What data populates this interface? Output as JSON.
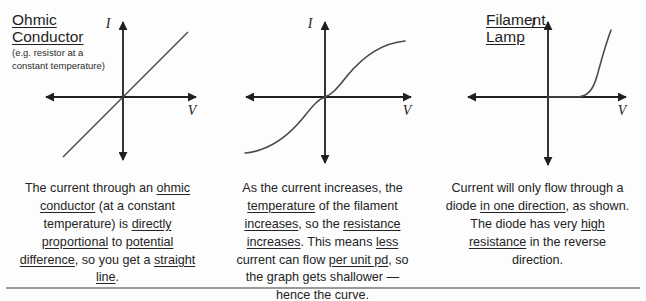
{
  "figure": {
    "panels": [
      {
        "id": "ohmic-conductor",
        "title": "Ohmic\nConductor",
        "title_line1": "Ohmic",
        "title_line2": "Conductor",
        "subtitle_line1": "(e.g. resistor at a",
        "subtitle_line2": "constant temperature)",
        "y_axis_label": "I",
        "x_axis_label": "V",
        "caption_segments": [
          {
            "text": "The current through an ",
            "underline": false
          },
          {
            "text": "ohmic conductor",
            "underline": true
          },
          {
            "text": " (at a constant temperature) is ",
            "underline": false
          },
          {
            "text": "directly proportional",
            "underline": true
          },
          {
            "text": " to ",
            "underline": false
          },
          {
            "text": "potential difference",
            "underline": true
          },
          {
            "text": ", so you get a ",
            "underline": false
          },
          {
            "text": "straight line",
            "underline": true
          },
          {
            "text": ".",
            "underline": false
          }
        ]
      },
      {
        "id": "filament-lamp",
        "title": "Filament\nLamp",
        "title_line1": "Filament",
        "title_line2": "Lamp",
        "subtitle_line1": "",
        "subtitle_line2": "",
        "y_axis_label": "I",
        "x_axis_label": "V",
        "caption_segments": [
          {
            "text": "As the current increases, the ",
            "underline": false
          },
          {
            "text": "temperature",
            "underline": true
          },
          {
            "text": " of the filament ",
            "underline": false
          },
          {
            "text": "increases",
            "underline": true
          },
          {
            "text": ", so the ",
            "underline": false
          },
          {
            "text": "resistance increases",
            "underline": true
          },
          {
            "text": ".  This means ",
            "underline": false
          },
          {
            "text": "less",
            "underline": true
          },
          {
            "text": " current can flow ",
            "underline": false
          },
          {
            "text": "per unit pd",
            "underline": true
          },
          {
            "text": ", so the graph gets shallower — hence the ",
            "underline": false
          },
          {
            "text": "curve",
            "underline": true
          },
          {
            "text": ".",
            "underline": false
          }
        ]
      },
      {
        "id": "diode",
        "title": "Diode",
        "title_line1": "Diode",
        "title_line2": "",
        "subtitle_line1": "",
        "subtitle_line2": "",
        "y_axis_label": "I",
        "x_axis_label": "V",
        "caption_segments": [
          {
            "text": "Current will only flow through a diode ",
            "underline": false
          },
          {
            "text": "in one direction",
            "underline": true
          },
          {
            "text": ", as shown. The diode has very ",
            "underline": false
          },
          {
            "text": "high resistance",
            "underline": true
          },
          {
            "text": " in the reverse direction.",
            "underline": false
          }
        ]
      }
    ]
  },
  "chart_data": [
    {
      "type": "line",
      "title": "Ohmic Conductor",
      "xlabel": "V",
      "ylabel": "I",
      "xlim": [
        -1,
        1
      ],
      "ylim": [
        -1,
        1
      ],
      "grid": false,
      "legend": "none",
      "annotation": "straight line through origin, positive constant gradient",
      "series": [
        {
          "name": "ohmic",
          "x": [
            -0.82,
            -0.4,
            0.0,
            0.4,
            0.82
          ],
          "y": [
            -0.82,
            -0.4,
            0.0,
            0.4,
            0.82
          ]
        }
      ]
    },
    {
      "type": "line",
      "title": "Filament Lamp",
      "xlabel": "V",
      "ylabel": "I",
      "xlim": [
        -1,
        1
      ],
      "ylim": [
        -1,
        1
      ],
      "grid": false,
      "legend": "none",
      "annotation": "S-shaped curve through origin, gradient decreases with magnitude of V",
      "series": [
        {
          "name": "filament",
          "x": [
            -0.95,
            -0.8,
            -0.6,
            -0.4,
            -0.2,
            0.0,
            0.2,
            0.4,
            0.6,
            0.8,
            0.95
          ],
          "y": [
            -0.72,
            -0.68,
            -0.58,
            -0.42,
            -0.22,
            0.0,
            0.22,
            0.42,
            0.58,
            0.68,
            0.72
          ]
        }
      ]
    },
    {
      "type": "line",
      "title": "Diode",
      "xlabel": "V",
      "ylabel": "I",
      "xlim": [
        -1,
        1
      ],
      "ylim": [
        -1,
        1
      ],
      "grid": false,
      "legend": "none",
      "annotation": "zero current for reverse and small forward bias; sharp exponential rise after threshold",
      "series": [
        {
          "name": "diode",
          "x": [
            -0.9,
            -0.4,
            0.0,
            0.18,
            0.3,
            0.4,
            0.48,
            0.55,
            0.62,
            0.7
          ],
          "y": [
            0.0,
            0.0,
            0.0,
            0.0,
            0.03,
            0.1,
            0.25,
            0.45,
            0.7,
            0.95
          ]
        }
      ]
    }
  ]
}
